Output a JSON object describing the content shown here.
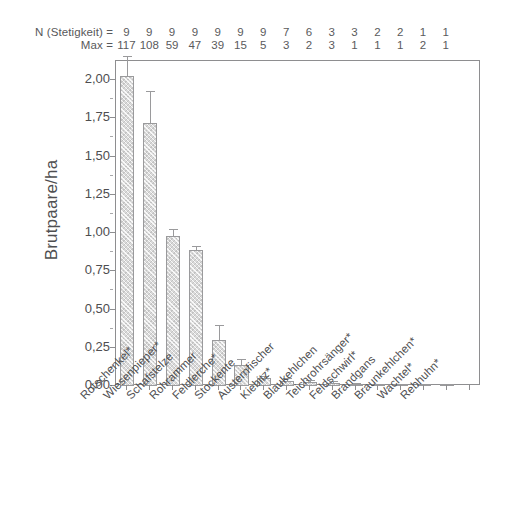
{
  "header": {
    "n_label": "N (Stetigkeit) =",
    "max_label": "Max =",
    "n_values": [
      "9",
      "9",
      "9",
      "9",
      "9",
      "9",
      "9",
      "7",
      "6",
      "3",
      "3",
      "2",
      "2",
      "1",
      "1"
    ],
    "max_values": [
      "117",
      "108",
      "59",
      "47",
      "39",
      "15",
      "5",
      "3",
      "2",
      "3",
      "1",
      "1",
      "1",
      "2",
      "1"
    ]
  },
  "chart_data": {
    "type": "bar",
    "title": "",
    "xlabel": "",
    "ylabel": "Brutpaare/ha",
    "ylim": [
      0,
      2.125
    ],
    "ytick_labels": [
      "0,00",
      "0,25",
      "0,50",
      "0,75",
      "1,00",
      "1,25",
      "1,50",
      "1,75",
      "2,00"
    ],
    "ytick_values": [
      0,
      0.25,
      0.5,
      0.75,
      1.0,
      1.25,
      1.5,
      1.75,
      2.0
    ],
    "grid": false,
    "legend": "none",
    "bar_color": "#d9d9d9",
    "bar_edge_color": "#9a9a9c",
    "categories": [
      "Rotschenkel*",
      "Wiesenpieper*",
      "Schafstelze",
      "Rohrammer",
      "Feldlerche*",
      "Stockente",
      "Austernfischer",
      "Kiebitz*",
      "Blaukehlchen",
      "Teichrohrsänger*",
      "Feldschwirl*",
      "Brandgans",
      "Braunkehlchen*",
      "Wachtel*",
      "Rebhuhn*"
    ],
    "values": [
      2.03,
      1.72,
      0.98,
      0.89,
      0.3,
      0.14,
      0.05,
      0.035,
      0.025,
      0.018,
      0.006,
      0.004,
      0.004,
      0.003,
      0.002
    ],
    "errors": [
      0.12,
      0.2,
      0.04,
      0.02,
      0.09,
      0.03,
      0.012,
      0.01,
      0.008,
      0.006,
      0.003,
      0.002,
      0.002,
      0.002,
      0.001
    ]
  }
}
